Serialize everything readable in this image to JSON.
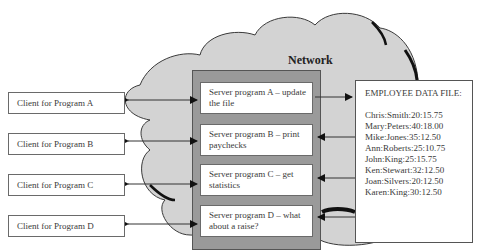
{
  "diagram": {
    "network_label": "Network",
    "clients": [
      {
        "label": "Client for Program A"
      },
      {
        "label": "Client for Program B"
      },
      {
        "label": "Client for Program C"
      },
      {
        "label": "Client for Program D"
      }
    ],
    "servers": [
      {
        "line1": "Server program A – update",
        "line2": "the file"
      },
      {
        "line1": "Server program B – print",
        "line2": "paychecks"
      },
      {
        "line1": "Server program C – get",
        "line2": "statistics"
      },
      {
        "line1": "Server program D – what",
        "line2": "about a raise?"
      }
    ],
    "data_file": {
      "title": "EMPLOYEE DATA FILE:",
      "records": [
        "Chris:Smith:20:15.75",
        "Mary:Peters:40:18.00",
        "Mike:Jones:35:12.50",
        "Ann:Roberts:25:10.75",
        "John:King:25:15.75",
        "Ken:Stewart:32:12.50",
        "Joan:Silvers:20:12.50",
        "Karen:King:30:12.50"
      ]
    },
    "colors": {
      "cloud_fill": "#d3d3d3",
      "cloud_stroke": "#3a3a3a",
      "server_frame": "#9a9a9a",
      "box_fill": "#ffffff"
    }
  }
}
